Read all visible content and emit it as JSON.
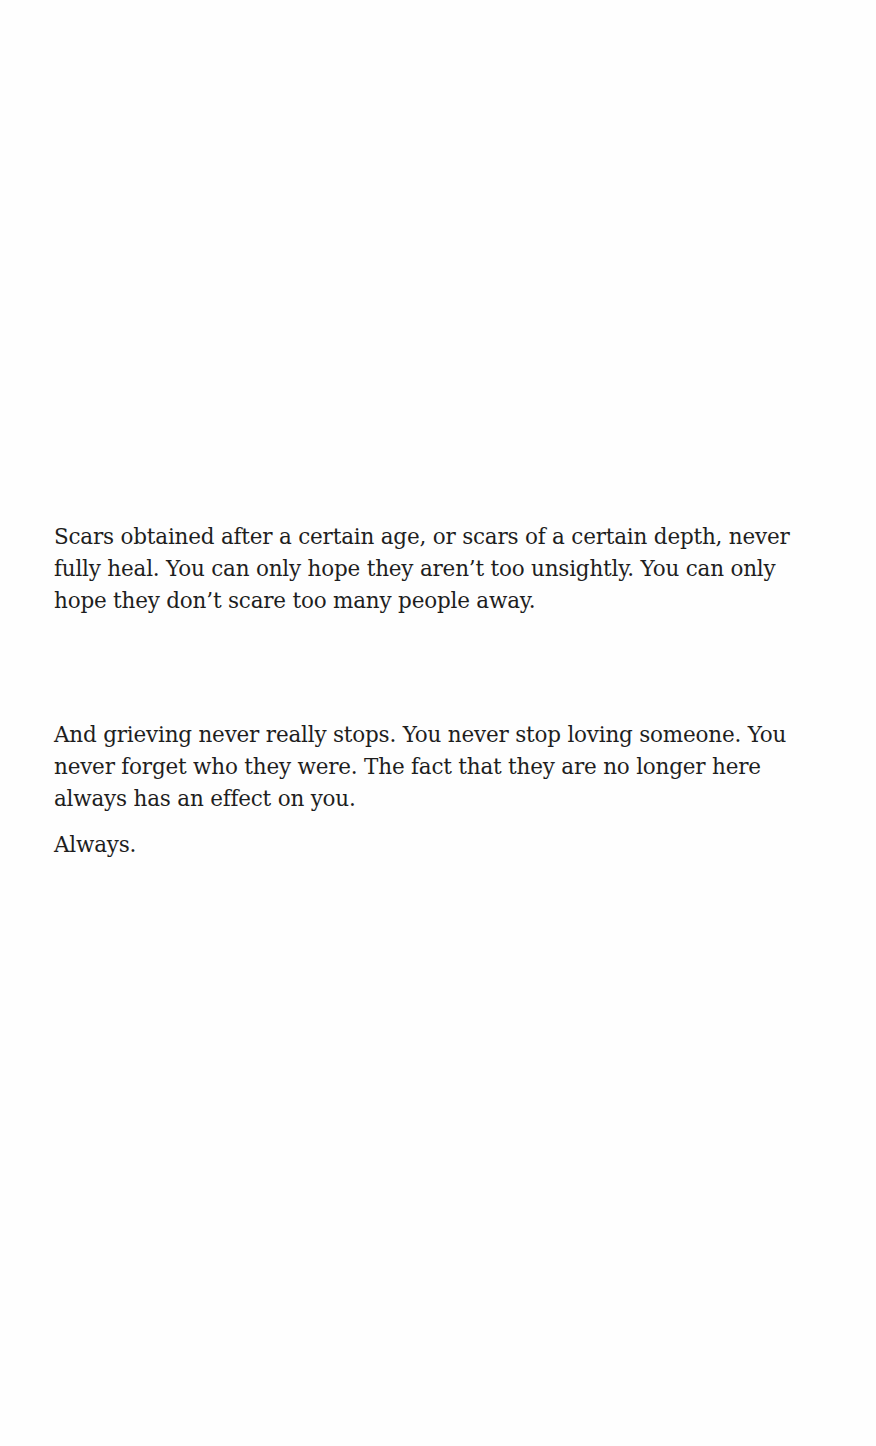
{
  "page": {
    "paragraphs": [
      {
        "lines": [
          "Scars obtained after a certain age, or scars of a certain depth, never",
          "fully heal. You can only hope they aren’t too unsightly. You can only",
          "hope they don’t scare too many people away."
        ]
      },
      {
        "lines": [
          "And grieving never really stops. You never stop loving someone. You",
          "never forget who they were. The fact that they are no longer here",
          "always has an effect on you."
        ]
      },
      {
        "lines": [
          "Always."
        ]
      }
    ]
  }
}
